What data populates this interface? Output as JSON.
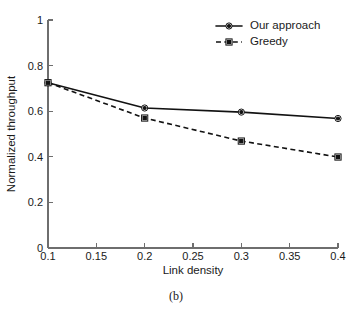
{
  "figure": {
    "caption": "(b)"
  },
  "chart_data": {
    "type": "line",
    "title": "",
    "xlabel": "Link density",
    "ylabel": "Normalized throughput",
    "xlim": [
      0.1,
      0.4
    ],
    "ylim": [
      0,
      1
    ],
    "grid": false,
    "legend_position": "top-right",
    "x": [
      0.1,
      0.2,
      0.3,
      0.4
    ],
    "xticks": [
      0.1,
      0.15,
      0.2,
      0.25,
      0.3,
      0.35,
      0.4
    ],
    "xtick_labels": [
      "0.1",
      "0.15",
      "0.2",
      "0.25",
      "0.3",
      "0.35",
      "0.4"
    ],
    "yticks": [
      0,
      0.2,
      0.4,
      0.6,
      0.8,
      1
    ],
    "ytick_labels": [
      "0",
      "0.2",
      "0.4",
      "0.6",
      "0.8",
      "1"
    ],
    "series": [
      {
        "name": "Our approach",
        "values": [
          0.725,
          0.614,
          0.596,
          0.568
        ],
        "line_style": "solid",
        "marker": "circle",
        "color": "#121212"
      },
      {
        "name": "Greedy",
        "values": [
          0.725,
          0.57,
          0.469,
          0.399
        ],
        "line_style": "dashed",
        "marker": "square",
        "color": "#121212"
      }
    ]
  },
  "legend": {
    "entries": [
      {
        "label": "Our approach"
      },
      {
        "label": "Greedy"
      }
    ]
  },
  "axis": {
    "x_title": "Link density",
    "y_title": "Normalized throughput"
  },
  "colors": {
    "ink": "#121212",
    "axis": "#6e6e6e",
    "background": "#ffffff"
  }
}
